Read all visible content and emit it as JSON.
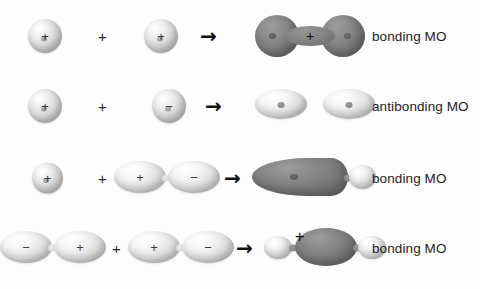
{
  "figure": {
    "background_color": "#fdfdfd",
    "dark_lobe_color": "#7b7b7b",
    "light_lobe_color": "#e0e0e0",
    "text_color": "#1d1d1d"
  },
  "glyphs": {
    "plus_operator": "+",
    "arrow": "→",
    "sign_plus": "+",
    "sign_minus": "−"
  },
  "rows": [
    {
      "id": "row-1",
      "label": "bonding MO",
      "reactant_1": {
        "type": "s-orbital",
        "sign": "+"
      },
      "operator": "+",
      "reactant_2": {
        "type": "s-orbital",
        "sign": "+"
      },
      "arrow": "→",
      "product": {
        "type": "sigma-bonding-mo",
        "shape": "peanut",
        "sign": "+",
        "shade": "dark"
      }
    },
    {
      "id": "row-2",
      "label": "antibonding MO",
      "reactant_1": {
        "type": "s-orbital",
        "sign": "+"
      },
      "operator": "+",
      "reactant_2": {
        "type": "s-orbital",
        "sign": "−"
      },
      "arrow": "→",
      "product": {
        "type": "sigma-antibonding-mo",
        "shape": "two-separate-ellipses",
        "sign": "",
        "shade": "light"
      }
    },
    {
      "id": "row-3",
      "label": "bonding MO",
      "reactant_1": {
        "type": "s-orbital",
        "sign": "+"
      },
      "operator": "+",
      "reactant_2": {
        "type": "p-orbital",
        "lobe_1_sign": "+",
        "lobe_2_sign": "−"
      },
      "arrow": "→",
      "product": {
        "type": "sp-bonding-mo",
        "shape": "large-dark-lobe-with-small-light-lobe",
        "shade": "dark"
      }
    },
    {
      "id": "row-4",
      "label": "bonding MO",
      "reactant_1": {
        "type": "p-orbital",
        "lobe_1_sign": "−",
        "lobe_2_sign": "+"
      },
      "operator": "+",
      "reactant_2": {
        "type": "p-orbital",
        "lobe_1_sign": "+",
        "lobe_2_sign": "−"
      },
      "arrow": "→",
      "product": {
        "type": "pp-bonding-mo",
        "shape": "large-dark-center-lobe-with-small-light-end-lobes",
        "sign": "+",
        "shade": "dark"
      }
    }
  ]
}
